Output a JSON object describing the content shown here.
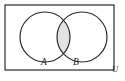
{
  "figure": {
    "type": "venn-diagram",
    "universe_label": "U",
    "background_color": "#fdfdfd"
  },
  "universe_rect": {
    "name": "universal-set-rectangle",
    "x": 5.0,
    "y": 5.0,
    "width": 109.0,
    "height": 65.0,
    "stroke": "#2b2b2b",
    "stroke_width": 1.2,
    "fill": "#ffffff"
  },
  "sets": [
    {
      "id": "A",
      "label": "A",
      "cx": 45.0,
      "cy": 37.0,
      "r": 25.0,
      "stroke": "#2b2b2b",
      "stroke_width": 1.2,
      "fill": "none",
      "label_x": 44.0,
      "label_y": 65.0
    },
    {
      "id": "B",
      "label": "B",
      "cx": 82.0,
      "cy": 37.0,
      "r": 25.0,
      "stroke": "#2b2b2b",
      "stroke_width": 1.2,
      "fill": "none",
      "label_x": 76.0,
      "label_y": 65.0
    }
  ],
  "shaded_region": {
    "name": "intersection-lens",
    "meaning": "A intersect B",
    "fill": "#e2e2e2",
    "stroke": "#2b2b2b",
    "stroke_width": 1.0
  },
  "universe_label_pos": {
    "x": 115.0,
    "y": 72.0
  }
}
